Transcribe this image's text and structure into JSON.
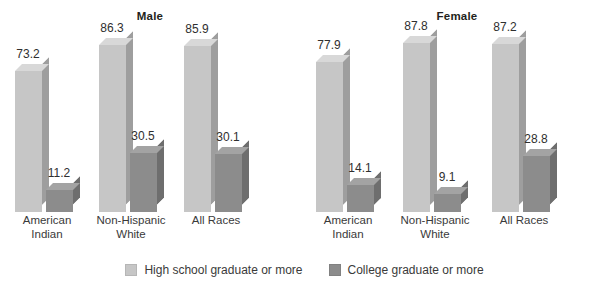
{
  "chart_data": {
    "type": "bar",
    "title": "",
    "xlabel": "",
    "ylabel": "",
    "ylim": [
      0,
      100
    ],
    "grid": false,
    "legend_position": "bottom-center",
    "categories": [
      "American Indian",
      "Non-Hispanic White",
      "All Races"
    ],
    "panels": [
      {
        "name": "Male",
        "series": [
          {
            "name": "High school graduate or more",
            "values": [
              73.2,
              86.3,
              85.9
            ]
          },
          {
            "name": "College graduate or more",
            "values": [
              11.2,
              30.5,
              30.1
            ]
          }
        ]
      },
      {
        "name": "Female",
        "series": [
          {
            "name": "High school graduate or more",
            "values": [
              77.9,
              87.8,
              87.2
            ]
          },
          {
            "name": "College graduate or more",
            "values": [
              14.1,
              9.1,
              28.8
            ]
          }
        ]
      }
    ],
    "legend": [
      {
        "label": "High school graduate or more",
        "color": "#c6c6c6"
      },
      {
        "label": "College graduate or more",
        "color": "#8c8c8c"
      }
    ]
  },
  "panels": [
    {
      "title": "Male",
      "groups": [
        {
          "label_line1": "American",
          "label_line2": "Indian",
          "bars": [
            {
              "value": "73.2",
              "series": "high-school"
            },
            {
              "value": "11.2",
              "series": "college"
            }
          ]
        },
        {
          "label_line1": "Non-Hispanic",
          "label_line2": "White",
          "bars": [
            {
              "value": "86.3",
              "series": "high-school"
            },
            {
              "value": "30.5",
              "series": "college"
            }
          ]
        },
        {
          "label_line1": "All Races",
          "label_line2": "",
          "bars": [
            {
              "value": "85.9",
              "series": "high-school"
            },
            {
              "value": "30.1",
              "series": "college"
            }
          ]
        }
      ]
    },
    {
      "title": "Female",
      "groups": [
        {
          "label_line1": "American",
          "label_line2": "Indian",
          "bars": [
            {
              "value": "77.9",
              "series": "high-school"
            },
            {
              "value": "14.1",
              "series": "college"
            }
          ]
        },
        {
          "label_line1": "Non-Hispanic",
          "label_line2": "White",
          "bars": [
            {
              "value": "87.8",
              "series": "high-school"
            },
            {
              "value": "9.1",
              "series": "college"
            }
          ]
        },
        {
          "label_line1": "All Races",
          "label_line2": "",
          "bars": [
            {
              "value": "87.2",
              "series": "high-school"
            },
            {
              "value": "28.8",
              "series": "college"
            }
          ]
        }
      ]
    }
  ],
  "legend": {
    "items": [
      {
        "label": "High school graduate or more",
        "swatch": "light"
      },
      {
        "label": "College graduate or more",
        "swatch": "dark"
      }
    ]
  },
  "colors": {
    "high_school_front": "#c6c6c6",
    "high_school_top": "#d8d8d8",
    "high_school_side": "#9e9e9e",
    "college_front": "#8c8c8c",
    "college_top": "#a3a3a3",
    "college_side": "#6e6e6e",
    "text": "#2f2f2f",
    "background": "#ffffff"
  }
}
